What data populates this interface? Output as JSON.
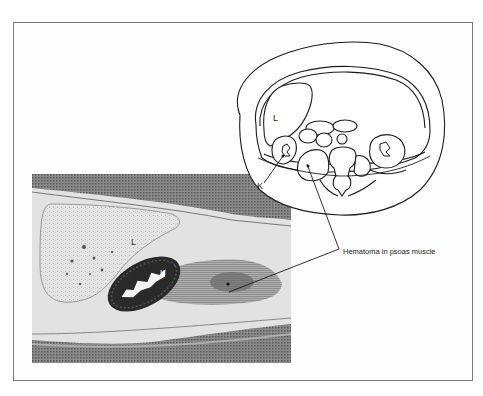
{
  "figure": {
    "schematic": {
      "labels": {
        "liver": "L",
        "kidney": "K"
      }
    },
    "ct_image": {
      "labels": {
        "liver": "L",
        "kidney": "K"
      }
    },
    "caption": "Hematoma in psoas muscle",
    "colors": {
      "frame_border": "#7a7a7a",
      "line_art": "#1a1a1a",
      "ct_background": "#6e6e6e",
      "ct_soft_tissue": "#d8d8d8",
      "ct_kidney": "#2a2a2a"
    }
  }
}
